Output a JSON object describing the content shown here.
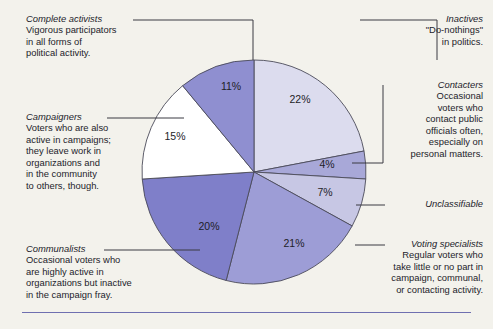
{
  "figure": {
    "background_color": "#f3f2ec",
    "rule_color": "#6f6fb0",
    "outline_color": "#4b4b59"
  },
  "chart_data": {
    "type": "pie",
    "title": "",
    "xlabel": "",
    "ylabel": "",
    "unit": "%",
    "legend_position": "callout-labels",
    "grid": false,
    "categories": [
      "Inactives",
      "Contacters",
      "Unclassifiable",
      "Voting specialists",
      "Communalists",
      "Campaigners",
      "Complete activists"
    ],
    "values": [
      22,
      4,
      7,
      21,
      20,
      15,
      11
    ],
    "labels": [
      "22%",
      "4%",
      "7%",
      "21%",
      "20%",
      "15%",
      "11%"
    ],
    "colors": [
      "#dcdcee",
      "#a8a8d8",
      "#c7c7e4",
      "#9d9dd6",
      "#7f7fc9",
      "#ffffff",
      "#8f8fd0"
    ],
    "start_angle_deg": -90,
    "direction": "clockwise"
  },
  "callouts": {
    "complete_activists": {
      "title": "Complete activists",
      "body": "Vigorous participators\nin all forms of\npolitical activity."
    },
    "campaigners": {
      "title": "Campaigners",
      "body": "Voters who are also\nactive in campaigns;\nthey leave work in\norganizations and\nin the community\nto others, though."
    },
    "communalists": {
      "title": "Communalists",
      "body": "Occasional voters who\nare highly active in\norganizations but inactive\nin the campaign fray."
    },
    "inactives": {
      "title": "Inactives",
      "body": "\"Do-nothings\"\nin politics."
    },
    "contacters": {
      "title": "Contacters",
      "body": "Occasional\nvoters who\ncontact public\nofficials often,\nespecially on\npersonal matters."
    },
    "unclassifiable": {
      "title": "Unclassifiable",
      "body": ""
    },
    "voting_specialists": {
      "title": "Voting specialists",
      "body": "Regular voters who\ntake little or no part in\ncampaign, communal,\nor contacting activity."
    }
  }
}
